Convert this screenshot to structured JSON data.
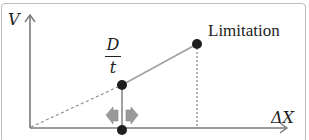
{
  "diagram": {
    "axes": {
      "y_label": "V",
      "x_label": "ΔX"
    },
    "labels": {
      "limitation": "Limitation",
      "fraction_numerator": "D",
      "fraction_denominator": "t"
    },
    "points": [
      {
        "name": "origin",
        "x": 30,
        "y": 128
      },
      {
        "name": "operating-point",
        "x": 122,
        "y": 85
      },
      {
        "name": "x-axis-marker",
        "x": 122,
        "y": 130
      },
      {
        "name": "limitation-point",
        "x": 197,
        "y": 44
      }
    ],
    "colors": {
      "axis": "#7a7a7a",
      "line": "#9e9e9e",
      "dot": "#1e1e1e",
      "arrow_fill": "#9a9a9a",
      "frame": "#bdbdbd"
    }
  }
}
